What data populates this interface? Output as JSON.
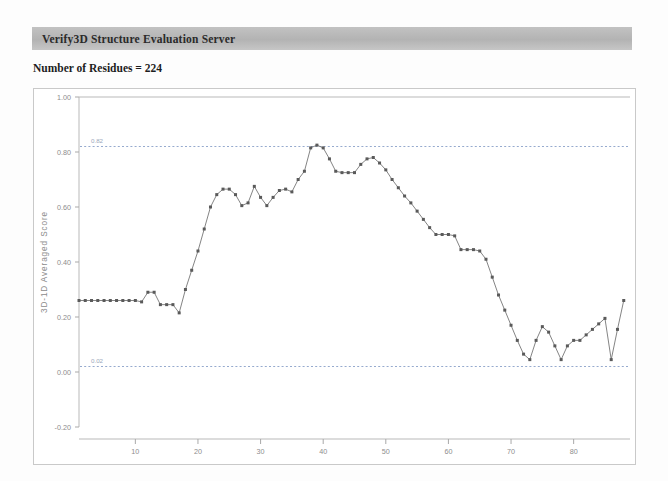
{
  "header": {
    "title": "Verify3D Structure Evaluation Server",
    "bar_color": "#b8b8b8"
  },
  "summary": {
    "residues_label": "Number of Residues = 224"
  },
  "chart_data": {
    "type": "line",
    "title": "",
    "xlabel": "",
    "ylabel": "3D-1D Averaged Score",
    "xlim": [
      1,
      89
    ],
    "ylim": [
      -0.2,
      1.0
    ],
    "grid": false,
    "legend": "none",
    "x_ticks": [
      10,
      20,
      30,
      40,
      50,
      60,
      70,
      80
    ],
    "y_ticks": [
      "1.00",
      "0.80",
      "0.60",
      "0.40",
      "0.20",
      "0.00",
      "-0.20"
    ],
    "y_tick_values": [
      1.0,
      0.8,
      0.6,
      0.4,
      0.2,
      0.0,
      -0.2
    ],
    "reference_lines": [
      {
        "label": "0.82",
        "value": 0.82,
        "style": "dashed",
        "color": "#8aa0c8"
      },
      {
        "label": "0.02",
        "value": 0.02,
        "style": "dashed",
        "color": "#8aa0c8"
      }
    ],
    "series": [
      {
        "name": "3D-1D Averaged Score",
        "marker": "square",
        "color": "#5a5a5a",
        "x": [
          1,
          2,
          3,
          4,
          5,
          6,
          7,
          8,
          9,
          10,
          11,
          12,
          13,
          14,
          15,
          16,
          17,
          18,
          19,
          20,
          21,
          22,
          23,
          24,
          25,
          26,
          27,
          28,
          29,
          30,
          31,
          32,
          33,
          34,
          35,
          36,
          37,
          38,
          39,
          40,
          41,
          42,
          43,
          44,
          45,
          46,
          47,
          48,
          49,
          50,
          51,
          52,
          53,
          54,
          55,
          56,
          57,
          58,
          59,
          60,
          61,
          62,
          63,
          64,
          65,
          66,
          67,
          68,
          69,
          70,
          71,
          72,
          73,
          74,
          75,
          76,
          77,
          78,
          79,
          80,
          81,
          82,
          83,
          84,
          85,
          86,
          87,
          88
        ],
        "values": [
          0.26,
          0.26,
          0.26,
          0.26,
          0.26,
          0.26,
          0.26,
          0.26,
          0.26,
          0.26,
          0.255,
          0.29,
          0.29,
          0.245,
          0.245,
          0.245,
          0.215,
          0.3,
          0.37,
          0.44,
          0.52,
          0.6,
          0.645,
          0.665,
          0.665,
          0.645,
          0.605,
          0.615,
          0.675,
          0.635,
          0.605,
          0.635,
          0.66,
          0.665,
          0.655,
          0.7,
          0.73,
          0.815,
          0.825,
          0.815,
          0.775,
          0.73,
          0.725,
          0.725,
          0.725,
          0.755,
          0.775,
          0.78,
          0.76,
          0.735,
          0.7,
          0.67,
          0.64,
          0.615,
          0.585,
          0.555,
          0.525,
          0.5,
          0.5,
          0.5,
          0.495,
          0.445,
          0.445,
          0.445,
          0.44,
          0.41,
          0.345,
          0.28,
          0.225,
          0.17,
          0.115,
          0.065,
          0.045,
          0.115,
          0.165,
          0.145,
          0.095,
          0.045,
          0.095,
          0.115,
          0.115,
          0.135,
          0.155,
          0.175,
          0.195,
          0.045,
          0.155,
          0.26
        ]
      }
    ]
  }
}
